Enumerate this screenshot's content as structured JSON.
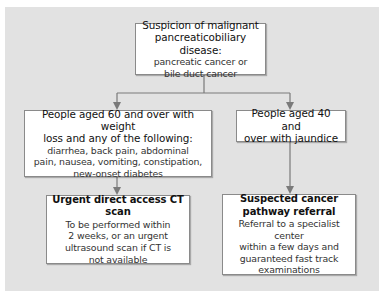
{
  "diagram": {
    "type": "flowchart",
    "colors": {
      "panel_background": "#e2e2e2",
      "box_background": "#ffffff",
      "box_border": "#8a8a8a",
      "connector": "#7a7a7a",
      "text": "#1a1a1a"
    },
    "nodes": {
      "root": {
        "title_lines": [
          "Suspicion of malignant",
          "pancreaticobiliary disease:"
        ],
        "body_lines": [
          "pancreatic cancer or",
          "bile duct cancer"
        ]
      },
      "left_criteria": {
        "title_lines": [
          "People aged 60 and over with weight",
          "loss and any of the following:"
        ],
        "body_lines": [
          "diarrhea, back pain, abdominal",
          "pain, nausea, vomiting, constipation,",
          "new-onset diabetes"
        ]
      },
      "right_criteria": {
        "title_lines": [
          "People aged 40 and",
          "over with jaundice"
        ],
        "body_lines": []
      },
      "left_action": {
        "title_lines": [
          "Urgent direct access CT scan"
        ],
        "body_lines": [
          "To be performed within",
          "2 weeks, or an urgent",
          "ultrasound scan if CT is",
          "not available"
        ]
      },
      "right_action": {
        "title_lines": [
          "Suspected cancer",
          "pathway referral"
        ],
        "body_lines": [
          "Referral to a specialist center",
          "within a few days and",
          "guaranteed fast track",
          "examinations"
        ]
      }
    },
    "edges": [
      {
        "from": "root",
        "to": "left_criteria"
      },
      {
        "from": "root",
        "to": "right_criteria"
      },
      {
        "from": "left_criteria",
        "to": "left_action"
      },
      {
        "from": "right_criteria",
        "to": "right_action"
      }
    ]
  }
}
